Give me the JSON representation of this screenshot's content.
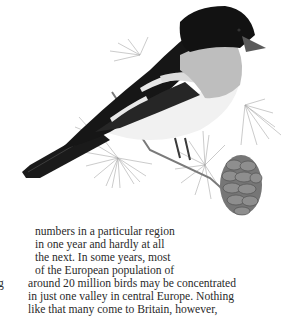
{
  "illustration": {
    "subject": "bird perched on larch branch with cone",
    "colors": {
      "head": "#141414",
      "back": "#1c1c1c",
      "throat": "#bdbdbd",
      "belly": "#f2f2f2",
      "wing_bar": "#e8e8e8",
      "needles": "#9a9a9a",
      "cone": "#6e6e6e"
    }
  },
  "body_text": {
    "lines": [
      "numbers in a particular region",
      "in one year and hardly at all",
      "the next. In some years, most",
      "of the European population of",
      "around 20 million birds may be concentrated",
      "in just one valley in central Europe. Nothing",
      "like that many come to Britain, however,"
    ],
    "margin_fragment": "g"
  },
  "colors": {
    "text": "#2a2a2a",
    "background": "#ffffff"
  }
}
